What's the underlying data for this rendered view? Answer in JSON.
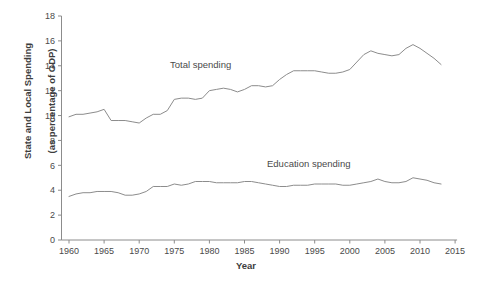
{
  "chart_data": {
    "type": "line",
    "title": "",
    "xlabel": "Year",
    "ylabel": "State and Local Spending\n(as percentage of GDP)",
    "xlim": [
      1958,
      2016
    ],
    "ylim": [
      0,
      18
    ],
    "xticks": [
      1960,
      1965,
      1970,
      1975,
      1980,
      1985,
      1990,
      1995,
      2000,
      2005,
      2010,
      2015
    ],
    "yticks": [
      0,
      2,
      4,
      6,
      8,
      10,
      12,
      14,
      16,
      18
    ],
    "grid": false,
    "legend": "inline-annotations",
    "line_color": "#8c8c8c",
    "axis_color": "#8c8c8c",
    "x": [
      1960,
      1961,
      1962,
      1963,
      1964,
      1965,
      1966,
      1967,
      1968,
      1969,
      1970,
      1971,
      1972,
      1973,
      1974,
      1975,
      1976,
      1977,
      1978,
      1979,
      1980,
      1981,
      1982,
      1983,
      1984,
      1985,
      1986,
      1987,
      1988,
      1989,
      1990,
      1991,
      1992,
      1993,
      1994,
      1995,
      1996,
      1997,
      1998,
      1999,
      2000,
      2001,
      2002,
      2003,
      2004,
      2005,
      2006,
      2007,
      2008,
      2009,
      2010,
      2011,
      2012,
      2013
    ],
    "series": [
      {
        "name": "Total spending",
        "label": "Total spending",
        "values": [
          9.9,
          10.1,
          10.1,
          10.2,
          10.3,
          10.5,
          9.6,
          9.6,
          9.6,
          9.5,
          9.4,
          9.8,
          10.1,
          10.1,
          10.4,
          11.3,
          11.4,
          11.4,
          11.3,
          11.4,
          12.0,
          12.1,
          12.2,
          12.1,
          11.9,
          12.1,
          12.4,
          12.4,
          12.3,
          12.4,
          12.9,
          13.3,
          13.6,
          13.6,
          13.6,
          13.6,
          13.5,
          13.4,
          13.4,
          13.5,
          13.7,
          14.3,
          14.9,
          15.2,
          15.0,
          14.9,
          14.8,
          14.9,
          15.4,
          15.7,
          15.4,
          15.0,
          14.6,
          14.1
        ]
      },
      {
        "name": "Education spending",
        "label": "Education spending",
        "values": [
          3.5,
          3.7,
          3.8,
          3.8,
          3.9,
          3.9,
          3.9,
          3.8,
          3.6,
          3.6,
          3.7,
          3.9,
          4.3,
          4.3,
          4.3,
          4.5,
          4.4,
          4.5,
          4.7,
          4.7,
          4.7,
          4.6,
          4.6,
          4.6,
          4.6,
          4.7,
          4.7,
          4.6,
          4.5,
          4.4,
          4.3,
          4.3,
          4.4,
          4.4,
          4.4,
          4.5,
          4.5,
          4.5,
          4.5,
          4.4,
          4.4,
          4.5,
          4.6,
          4.7,
          4.9,
          4.7,
          4.6,
          4.6,
          4.7,
          5.0,
          4.9,
          4.8,
          4.6,
          4.5
        ]
      }
    ]
  },
  "axis": {
    "x_title": "Year",
    "y_title_line1": "State and Local Spending",
    "y_title_line2": "(as percentage of GDP)"
  }
}
